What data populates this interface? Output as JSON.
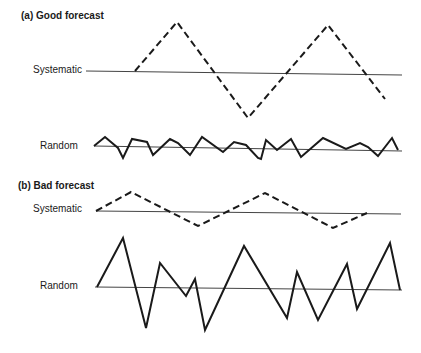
{
  "panels": [
    {
      "heading": "(a) Good forecast",
      "systematic_label": "Systematic",
      "random_label": "Random",
      "systematic": {
        "baseline": [
          [
            86,
            71
          ],
          [
            402,
            75
          ]
        ],
        "points": [
          [
            135,
            71
          ],
          [
            177,
            22
          ],
          [
            248,
            118
          ],
          [
            328,
            25
          ],
          [
            385,
            99
          ]
        ],
        "style": "dashed"
      },
      "random": {
        "baseline": [
          [
            94,
            146
          ],
          [
            402,
            151
          ]
        ],
        "points": [
          [
            94,
            146
          ],
          [
            105,
            137
          ],
          [
            118,
            148
          ],
          [
            123,
            158
          ],
          [
            132,
            139
          ],
          [
            147,
            142
          ],
          [
            153,
            155
          ],
          [
            170,
            139
          ],
          [
            178,
            143
          ],
          [
            190,
            155
          ],
          [
            202,
            137
          ],
          [
            223,
            152
          ],
          [
            234,
            142
          ],
          [
            246,
            145
          ],
          [
            258,
            158
          ],
          [
            261,
            159
          ],
          [
            266,
            140
          ],
          [
            277,
            150
          ],
          [
            291,
            139
          ],
          [
            301,
            157
          ],
          [
            323,
            138
          ],
          [
            346,
            149
          ],
          [
            360,
            143
          ],
          [
            368,
            147
          ],
          [
            378,
            156
          ],
          [
            392,
            138
          ],
          [
            398,
            150
          ]
        ],
        "style": "solid"
      }
    },
    {
      "heading": "(b) Bad forecast",
      "systematic_label": "Systematic",
      "random_label": "Random",
      "systematic": {
        "baseline": [
          [
            96,
            211
          ],
          [
            401,
            214
          ]
        ],
        "points": [
          [
            96,
            211
          ],
          [
            131,
            192
          ],
          [
            198,
            226
          ],
          [
            265,
            193
          ],
          [
            333,
            228
          ],
          [
            367,
            213
          ]
        ],
        "style": "dashed"
      },
      "random": {
        "baseline": [
          [
            95,
            287
          ],
          [
            402,
            290
          ]
        ],
        "points": [
          [
            97,
            287
          ],
          [
            123,
            238
          ],
          [
            146,
            328
          ],
          [
            160,
            263
          ],
          [
            186,
            296
          ],
          [
            195,
            279
          ],
          [
            205,
            330
          ],
          [
            244,
            246
          ],
          [
            287,
            318
          ],
          [
            297,
            272
          ],
          [
            318,
            320
          ],
          [
            347,
            264
          ],
          [
            357,
            309
          ],
          [
            390,
            243
          ],
          [
            400,
            290
          ]
        ],
        "style": "solid"
      }
    }
  ],
  "colors": {
    "line": "#1a1a1a",
    "baseline": "#444444",
    "background": "#ffffff"
  }
}
